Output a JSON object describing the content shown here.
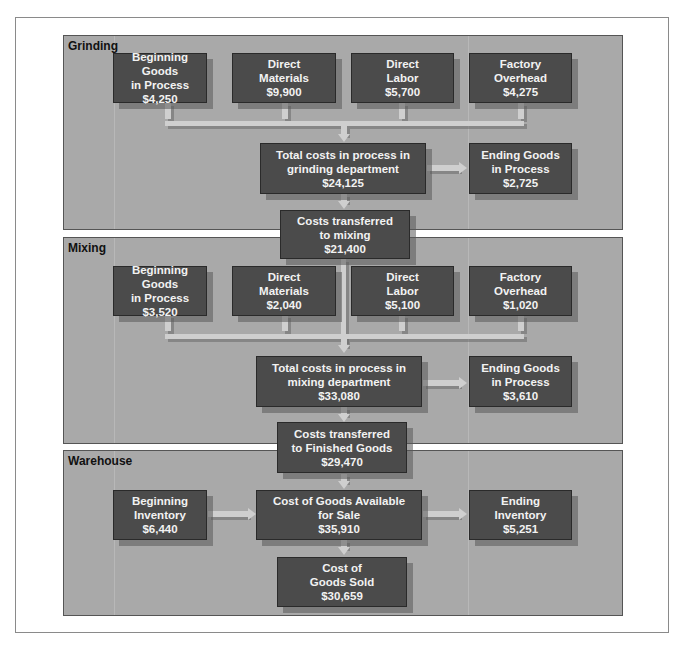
{
  "diagram": {
    "sections": {
      "grinding": {
        "title": "Grinding",
        "inputs": [
          {
            "line1": "Beginning Goods",
            "line2": "in Process",
            "value": "$4,250"
          },
          {
            "line1": "Direct",
            "line2": "Materials",
            "value": "$9,900"
          },
          {
            "line1": "Direct",
            "line2": "Labor",
            "value": "$5,700"
          },
          {
            "line1": "Factory",
            "line2": "Overhead",
            "value": "$4,275"
          }
        ],
        "total": {
          "line1": "Total costs in process in",
          "line2": "grinding department",
          "value": "$24,125"
        },
        "ending": {
          "line1": "Ending Goods",
          "line2": "in Process",
          "value": "$2,725"
        },
        "transfer": {
          "line1": "Costs transferred",
          "line2": "to mixing",
          "value": "$21,400"
        }
      },
      "mixing": {
        "title": "Mixing",
        "inputs": [
          {
            "line1": "Beginning Goods",
            "line2": "in Process",
            "value": "$3,520"
          },
          {
            "line1": "Direct",
            "line2": "Materials",
            "value": "$2,040"
          },
          {
            "line1": "Direct",
            "line2": "Labor",
            "value": "$5,100"
          },
          {
            "line1": "Factory",
            "line2": "Overhead",
            "value": "$1,020"
          }
        ],
        "total": {
          "line1": "Total costs in process in",
          "line2": "mixing department",
          "value": "$33,080"
        },
        "ending": {
          "line1": "Ending Goods",
          "line2": "in Process",
          "value": "$3,610"
        },
        "transfer": {
          "line1": "Costs transferred",
          "line2": "to Finished Goods",
          "value": "$29,470"
        }
      },
      "warehouse": {
        "title": "Warehouse",
        "beginning": {
          "line1": "Beginning",
          "line2": "Inventory",
          "value": "$6,440"
        },
        "available": {
          "line1": "Cost of Goods Available",
          "line2": "for Sale",
          "value": "$35,910"
        },
        "ending": {
          "line1": "Ending",
          "line2": "Inventory",
          "value": "$5,251"
        },
        "cogs": {
          "line1": "Cost of",
          "line2": "Goods Sold",
          "value": "$30,659"
        }
      }
    },
    "colors": {
      "panel": "#a9a9a9",
      "box": "#4b4b4b",
      "arrow": "#cfcfcf",
      "text": "#f2f2f2"
    }
  }
}
